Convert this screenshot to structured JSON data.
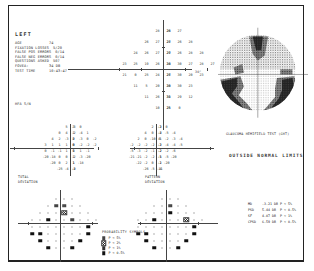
{
  "report": {
    "eye": "LEFT",
    "patient_info": [
      {
        "key": "AGE",
        "value": "74"
      },
      {
        "key": "FIXATION LOSSES",
        "value": "5/20"
      },
      {
        "key": "FALSE POS ERRORS",
        "value": "0/14"
      },
      {
        "key": "FALSE NEG ERRORS",
        "value": "0/14"
      },
      {
        "key": "QUESTIONS ASKED",
        "value": "507"
      },
      {
        "key": "FOVEA:",
        "value": "34 DB"
      },
      {
        "key": "TEST TIME",
        "value": "10:43:47"
      }
    ],
    "hfa_sn": "HFA S/N",
    "axis_label_30": "30°",
    "ght_label": "GLAUCOMA HEMIFIELD TEST (GHT)",
    "ght_result": "OUTSIDE NORMAL LIMITS",
    "total_deviation_label": [
      "TOTAL",
      "DEVIATION"
    ],
    "pattern_deviation_label": [
      "PATTERN",
      "DEVIATION"
    ],
    "probability_legend": {
      "title": "PROBABILITY SYMBOLS",
      "items": [
        {
          "symbol": "s1",
          "label": "P < 5%"
        },
        {
          "symbol": "s2",
          "label": "P < 2%"
        },
        {
          "symbol": "s3",
          "label": "P < 1%"
        },
        {
          "symbol": "s4",
          "label": "P < 0.5%"
        }
      ]
    },
    "global_indices": [
      {
        "name": "MD",
        "value": "-3.21 DB",
        "p": "P < 5%"
      },
      {
        "name": "PSD",
        "value": "5.44 DB",
        "p": "P < 0.5%"
      },
      {
        "name": "SF",
        "value": "4.07 DB",
        "p": "P < 1%"
      },
      {
        "name": "CPSD",
        "value": "6.59 DB",
        "p": "P < 0.5%"
      }
    ]
  },
  "threshold_values": [
    {
      "x": -1,
      "y": 4,
      "v": "28"
    },
    {
      "x": 0,
      "y": 4,
      "v": "28"
    },
    {
      "x": 1,
      "y": 4,
      "v": "26"
    },
    {
      "x": 2,
      "y": 4,
      "v": "27"
    },
    {
      "x": -2,
      "y": 3,
      "v": "26"
    },
    {
      "x": -1,
      "y": 3,
      "v": "27"
    },
    {
      "x": 0,
      "y": 3,
      "v": "28"
    },
    {
      "x": 1,
      "y": 3,
      "v": "27"
    },
    {
      "x": 2,
      "y": 3,
      "v": "26"
    },
    {
      "x": 3,
      "y": 3,
      "v": "28"
    },
    {
      "x": -3,
      "y": 2,
      "v": "24"
    },
    {
      "x": -2,
      "y": 2,
      "v": "26"
    },
    {
      "x": -1,
      "y": 2,
      "v": "27"
    },
    {
      "x": 0,
      "y": 2,
      "v": "29"
    },
    {
      "x": 1,
      "y": 2,
      "v": "27"
    },
    {
      "x": 2,
      "y": 2,
      "v": "26"
    },
    {
      "x": 3,
      "y": 2,
      "v": "28"
    },
    {
      "x": 4,
      "y": 2,
      "v": "28"
    },
    {
      "x": -4,
      "y": 1,
      "v": "23"
    },
    {
      "x": -3,
      "y": 1,
      "v": "25"
    },
    {
      "x": -2,
      "y": 1,
      "v": "19"
    },
    {
      "x": -1,
      "y": 1,
      "v": "26"
    },
    {
      "x": 0,
      "y": 1,
      "v": "24"
    },
    {
      "x": 1,
      "y": 1,
      "v": "30"
    },
    {
      "x": 2,
      "y": 1,
      "v": "30"
    },
    {
      "x": 3,
      "y": 1,
      "v": "27"
    },
    {
      "x": 4,
      "y": 1,
      "v": "28"
    },
    {
      "x": 5,
      "y": 1,
      "v": "27"
    },
    {
      "x": -4,
      "y": -1,
      "v": "21"
    },
    {
      "x": -3,
      "y": -1,
      "v": "0"
    },
    {
      "x": -2,
      "y": -1,
      "v": "25"
    },
    {
      "x": -1,
      "y": -1,
      "v": "24"
    },
    {
      "x": 0,
      "y": -1,
      "v": "27"
    },
    {
      "x": 1,
      "y": -1,
      "v": "26"
    },
    {
      "x": 2,
      "y": -1,
      "v": "30"
    },
    {
      "x": 3,
      "y": -1,
      "v": "20"
    },
    {
      "x": 4,
      "y": -1,
      "v": "23"
    },
    {
      "x": -3,
      "y": -2,
      "v": "11"
    },
    {
      "x": -2,
      "y": -2,
      "v": "5"
    },
    {
      "x": -1,
      "y": -2,
      "v": "20"
    },
    {
      "x": 0,
      "y": -2,
      "v": "30"
    },
    {
      "x": 1,
      "y": -2,
      "v": "28"
    },
    {
      "x": 2,
      "y": -2,
      "v": "30"
    },
    {
      "x": 3,
      "y": -2,
      "v": "23"
    },
    {
      "x": -2,
      "y": -3,
      "v": "11"
    },
    {
      "x": -1,
      "y": -3,
      "v": "26"
    },
    {
      "x": 0,
      "y": -3,
      "v": "31"
    },
    {
      "x": 1,
      "y": -3,
      "v": "30"
    },
    {
      "x": 2,
      "y": -3,
      "v": "29"
    },
    {
      "x": 3,
      "y": -3,
      "v": "12"
    },
    {
      "x": -1,
      "y": -4,
      "v": "10"
    },
    {
      "x": 0,
      "y": -4,
      "v": "25"
    },
    {
      "x": 1,
      "y": -4,
      "v": "25"
    },
    {
      "x": 2,
      "y": -4,
      "v": "0"
    }
  ],
  "total_deviation": [
    {
      "x": -1,
      "y": 4,
      "v": "5"
    },
    {
      "x": 0,
      "y": 4,
      "v": "3"
    },
    {
      "x": 1,
      "y": 4,
      "v": "-3"
    },
    {
      "x": 2,
      "y": 4,
      "v": "0"
    },
    {
      "x": -2,
      "y": 3,
      "v": "0"
    },
    {
      "x": -1,
      "y": 3,
      "v": "4"
    },
    {
      "x": 0,
      "y": 3,
      "v": "1"
    },
    {
      "x": 1,
      "y": 3,
      "v": "-2"
    },
    {
      "x": 2,
      "y": 3,
      "v": "-4"
    },
    {
      "x": 3,
      "y": 3,
      "v": "1"
    },
    {
      "x": -3,
      "y": 2,
      "v": "4"
    },
    {
      "x": -2,
      "y": 2,
      "v": "2"
    },
    {
      "x": -1,
      "y": 2,
      "v": "-3"
    },
    {
      "x": 0,
      "y": 2,
      "v": "2"
    },
    {
      "x": 1,
      "y": 2,
      "v": "0"
    },
    {
      "x": 2,
      "y": 2,
      "v": "-3"
    },
    {
      "x": 3,
      "y": 2,
      "v": "0"
    },
    {
      "x": 4,
      "y": 2,
      "v": "-2"
    },
    {
      "x": -4,
      "y": 1,
      "v": "3"
    },
    {
      "x": -3,
      "y": 1,
      "v": "1"
    },
    {
      "x": -2,
      "y": 1,
      "v": "1"
    },
    {
      "x": -1,
      "y": 1,
      "v": "1"
    },
    {
      "x": 0,
      "y": 1,
      "v": "0"
    },
    {
      "x": 1,
      "y": 1,
      "v": "0"
    },
    {
      "x": 2,
      "y": 1,
      "v": "-2"
    },
    {
      "x": 3,
      "y": 1,
      "v": "-2"
    },
    {
      "x": 4,
      "y": 1,
      "v": "-2"
    },
    {
      "x": -4,
      "y": -1,
      "v": "0"
    },
    {
      "x": -3,
      "y": -1,
      "v": "-1"
    },
    {
      "x": -2,
      "y": -1,
      "v": "-1"
    },
    {
      "x": -1,
      "y": -1,
      "v": "1"
    },
    {
      "x": 0,
      "y": -1,
      "v": "1"
    },
    {
      "x": 1,
      "y": -1,
      "v": "0"
    },
    {
      "x": 2,
      "y": -1,
      "v": "1"
    },
    {
      "x": 3,
      "y": -1,
      "v": "-1"
    },
    {
      "x": -4,
      "y": -2,
      "v": "-20"
    },
    {
      "x": -3,
      "y": -2,
      "v": "-18"
    },
    {
      "x": -2,
      "y": -2,
      "v": "0"
    },
    {
      "x": -1,
      "y": -2,
      "v": "0"
    },
    {
      "x": 0,
      "y": -2,
      "v": "1"
    },
    {
      "x": 1,
      "y": -2,
      "v": "-2"
    },
    {
      "x": 2,
      "y": -2,
      "v": "-3"
    },
    {
      "x": 3,
      "y": -2,
      "v": "-20"
    },
    {
      "x": -3,
      "y": -3,
      "v": "-20"
    },
    {
      "x": -2,
      "y": -3,
      "v": "0"
    },
    {
      "x": -1,
      "y": -3,
      "v": "2"
    },
    {
      "x": 0,
      "y": -3,
      "v": "1"
    },
    {
      "x": 1,
      "y": -3,
      "v": "1"
    },
    {
      "x": 2,
      "y": -3,
      "v": "-18"
    },
    {
      "x": -2,
      "y": -4,
      "v": "-25"
    },
    {
      "x": -1,
      "y": -4,
      "v": "-4"
    },
    {
      "x": 0,
      "y": -4,
      "v": "-2"
    },
    {
      "x": 1,
      "y": -4,
      "v": "-8"
    }
  ],
  "pattern_deviation": [
    {
      "x": -1,
      "y": 4,
      "v": "2"
    },
    {
      "x": 0,
      "y": 4,
      "v": "-2"
    },
    {
      "x": 1,
      "y": 4,
      "v": "-3"
    },
    {
      "x": 2,
      "y": 4,
      "v": "0"
    },
    {
      "x": -2,
      "y": 3,
      "v": "4"
    },
    {
      "x": -1,
      "y": 3,
      "v": "0"
    },
    {
      "x": 0,
      "y": 3,
      "v": "-4"
    },
    {
      "x": 1,
      "y": 3,
      "v": "-2"
    },
    {
      "x": 2,
      "y": 3,
      "v": "-5"
    },
    {
      "x": 3,
      "y": 3,
      "v": "-4"
    },
    {
      "x": -3,
      "y": 2,
      "v": "2"
    },
    {
      "x": -2,
      "y": 2,
      "v": "0"
    },
    {
      "x": -1,
      "y": 2,
      "v": "-10"
    },
    {
      "x": 0,
      "y": 2,
      "v": "-1"
    },
    {
      "x": 1,
      "y": 2,
      "v": "0"
    },
    {
      "x": 2,
      "y": 2,
      "v": "-2"
    },
    {
      "x": 3,
      "y": 2,
      "v": "-3"
    },
    {
      "x": 4,
      "y": 2,
      "v": "-4"
    },
    {
      "x": -4,
      "y": 1,
      "v": "-2"
    },
    {
      "x": -3,
      "y": 1,
      "v": "-2"
    },
    {
      "x": -2,
      "y": 1,
      "v": "-2"
    },
    {
      "x": -1,
      "y": 1,
      "v": "-2"
    },
    {
      "x": 0,
      "y": 1,
      "v": "-2"
    },
    {
      "x": 1,
      "y": 1,
      "v": "-3"
    },
    {
      "x": 2,
      "y": 1,
      "v": "-4"
    },
    {
      "x": 3,
      "y": 1,
      "v": "-4"
    },
    {
      "x": 4,
      "y": 1,
      "v": "-5"
    },
    {
      "x": -4,
      "y": -1,
      "v": "-5"
    },
    {
      "x": -3,
      "y": -1,
      "v": "-3"
    },
    {
      "x": -2,
      "y": -1,
      "v": "-2"
    },
    {
      "x": -1,
      "y": -1,
      "v": "-1"
    },
    {
      "x": 0,
      "y": -1,
      "v": "-2"
    },
    {
      "x": 1,
      "y": -1,
      "v": "-2"
    },
    {
      "x": 2,
      "y": -1,
      "v": "-2"
    },
    {
      "x": 3,
      "y": -1,
      "v": "-6"
    },
    {
      "x": -4,
      "y": -2,
      "v": "-21"
    },
    {
      "x": -3,
      "y": -2,
      "v": "-21"
    },
    {
      "x": -2,
      "y": -2,
      "v": "-2"
    },
    {
      "x": -1,
      "y": -2,
      "v": "-2"
    },
    {
      "x": 0,
      "y": -2,
      "v": "-1"
    },
    {
      "x": 1,
      "y": -2,
      "v": "-5"
    },
    {
      "x": 2,
      "y": -2,
      "v": "-5"
    },
    {
      "x": 3,
      "y": -2,
      "v": "-20"
    },
    {
      "x": -3,
      "y": -3,
      "v": "-22"
    },
    {
      "x": -2,
      "y": -3,
      "v": "-2"
    },
    {
      "x": -1,
      "y": -3,
      "v": "0"
    },
    {
      "x": 0,
      "y": -3,
      "v": "-2"
    },
    {
      "x": 1,
      "y": -3,
      "v": "-1"
    },
    {
      "x": 2,
      "y": -3,
      "v": "-20"
    },
    {
      "x": -2,
      "y": -4,
      "v": "-26"
    },
    {
      "x": -1,
      "y": -4,
      "v": "-5"
    },
    {
      "x": 0,
      "y": -4,
      "v": "-4"
    },
    {
      "x": 1,
      "y": -4,
      "v": "-11"
    }
  ],
  "total_deviation_prob": [
    {
      "x": -1,
      "y": 3,
      "s": "s1"
    },
    {
      "x": 0,
      "y": 3,
      "s": "s1"
    },
    {
      "x": 0,
      "y": 2,
      "s": "s2"
    },
    {
      "x": -2,
      "y": 1,
      "s": "s4"
    },
    {
      "x": 2,
      "y": 1,
      "s": "s1"
    },
    {
      "x": 4,
      "y": -1,
      "s": "s4"
    },
    {
      "x": -4,
      "y": -2,
      "s": "s4"
    },
    {
      "x": -3,
      "y": -2,
      "s": "s4"
    },
    {
      "x": 4,
      "y": -2,
      "s": "s4"
    },
    {
      "x": -3,
      "y": -3,
      "s": "s4"
    },
    {
      "x": 3,
      "y": -3,
      "s": "s4"
    },
    {
      "x": -2,
      "y": -4,
      "s": "s4"
    },
    {
      "x": 2,
      "y": -4,
      "s": "s4"
    }
  ],
  "pattern_deviation_prob": [
    {
      "x": 0,
      "y": 3,
      "s": "s1"
    },
    {
      "x": 1,
      "y": 2,
      "s": "s4"
    },
    {
      "x": -2,
      "y": 1,
      "s": "s4"
    },
    {
      "x": 3,
      "y": 1,
      "s": "s2"
    },
    {
      "x": 4,
      "y": -1,
      "s": "s4"
    },
    {
      "x": -4,
      "y": -2,
      "s": "s4"
    },
    {
      "x": -3,
      "y": -2,
      "s": "s4"
    },
    {
      "x": 4,
      "y": -2,
      "s": "s4"
    },
    {
      "x": -3,
      "y": -3,
      "s": "s4"
    },
    {
      "x": 3,
      "y": -3,
      "s": "s4"
    },
    {
      "x": -2,
      "y": -4,
      "s": "s4"
    },
    {
      "x": 2,
      "y": -4,
      "s": "s4"
    }
  ]
}
